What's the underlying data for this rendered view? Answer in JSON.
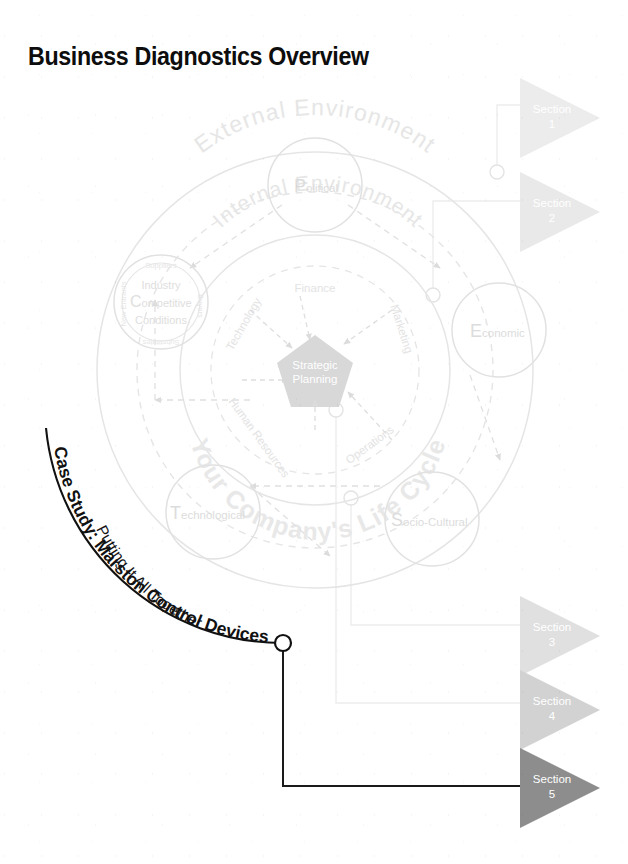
{
  "page": {
    "title": "Business Diagnostics Overview",
    "width": 628,
    "height": 864,
    "background": "#ffffff"
  },
  "colors": {
    "title_text": "#0d0d0d",
    "diagram_line": "#e2e2e2",
    "diagram_text": "#e4e4e4",
    "pentagon_fill": "#d8d8d8",
    "pentagon_text": "#ffffff",
    "connector_line": "#ededed",
    "connector_line_dark": "#1a1a1a",
    "section_1_fill": "#ececec",
    "section_2_fill": "#e9e9e9",
    "section_3_fill": "#e0e0e0",
    "section_4_fill": "#d2d2d2",
    "section_5_fill": "#8d8d8d",
    "section_label": "#ffffff",
    "case_study_text": "#111111"
  },
  "diagram": {
    "outer_ring_label": "External Environment",
    "middle_ring_label": "Internal Environment",
    "lifecycle_ring_label": "Your Company's Life Cycle",
    "center": {
      "label_line1": "Strategic",
      "label_line2": "Planning",
      "shape": "pentagon"
    },
    "internal_functions": [
      {
        "name": "Finance",
        "position": "top"
      },
      {
        "name": "Marketing",
        "position": "upper-right"
      },
      {
        "name": "Operations",
        "position": "lower-right"
      },
      {
        "name": "Human Resources",
        "position": "lower-left"
      },
      {
        "name": "Technology",
        "position": "upper-left"
      }
    ],
    "external_forces": [
      {
        "initial": "P",
        "rest": "olitical",
        "position": "top"
      },
      {
        "initial": "E",
        "rest": "conomic",
        "position": "right"
      },
      {
        "initial": "S",
        "rest": "ocio-Cultural",
        "position": "bottom-right"
      },
      {
        "initial": "T",
        "rest": "echnological",
        "position": "bottom-left"
      },
      {
        "initial": "C",
        "rest": "ompetitive",
        "position": "left"
      }
    ],
    "industry_circle": {
      "line1": "Industry",
      "initial": "C",
      "line2_rest": "ompetitive",
      "line3": "Conditions",
      "forces": [
        {
          "label": "Suppliers",
          "position": "top"
        },
        {
          "label": "Buyers",
          "position": "right"
        },
        {
          "label": "Substitutes",
          "position": "bottom"
        },
        {
          "label": "New Entrants",
          "position": "left"
        }
      ]
    }
  },
  "case_study": {
    "line_outer": "Case Study: Marston Control Devices",
    "line_inner": "Putting It All Together"
  },
  "sections": [
    {
      "id": 1,
      "label_line1": "Section",
      "label_line2": "1",
      "tone": "lightest"
    },
    {
      "id": 2,
      "label_line1": "Section",
      "label_line2": "2",
      "tone": "lighter"
    },
    {
      "id": 3,
      "label_line1": "Section",
      "label_line2": "3",
      "tone": "light"
    },
    {
      "id": 4,
      "label_line1": "Section",
      "label_line2": "4",
      "tone": "medium"
    },
    {
      "id": 5,
      "label_line1": "Section",
      "label_line2": "5",
      "tone": "dark"
    }
  ]
}
